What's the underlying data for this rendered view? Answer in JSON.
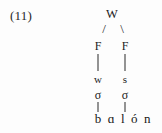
{
  "example": {
    "number_label": "(11)"
  },
  "diagram": {
    "type": "metrical-tree",
    "title_text": "",
    "root": {
      "label": "W",
      "meaning": "word-icon"
    },
    "feet": [
      {
        "label": "F",
        "side": "left"
      },
      {
        "label": "F",
        "side": "right"
      }
    ],
    "branches": [
      {
        "glyph": "/",
        "side": "left"
      },
      {
        "glyph": "\\",
        "side": "right"
      }
    ],
    "strength": [
      {
        "label": "w",
        "side": "left"
      },
      {
        "label": "s",
        "side": "right"
      }
    ],
    "syllables": [
      {
        "label": "σ",
        "side": "left"
      },
      {
        "label": "σ",
        "side": "right"
      }
    ],
    "surface_form": "b ɑ l ó n",
    "colors": {
      "text": "#1d1d1d",
      "line": "#2b2b2b",
      "background": "#fdfdfd"
    }
  }
}
